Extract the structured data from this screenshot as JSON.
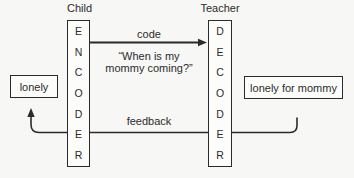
{
  "diagram": {
    "left_role": "Child",
    "right_role": "Teacher",
    "encoder_letters": [
      "E",
      "N",
      "C",
      "O",
      "D",
      "E",
      "R"
    ],
    "decoder_letters": [
      "D",
      "E",
      "C",
      "O",
      "D",
      "E",
      "R"
    ],
    "code_label": "code",
    "feedback_label": "feedback",
    "message_line1": "“When is my",
    "message_line2": "mommy coming?”",
    "left_feeling": "lonely",
    "right_feeling": "lonely for mommy",
    "colors": {
      "ink": "#2b2b2b",
      "background": "#f7f7f5",
      "box_fill": "#fcfcfb"
    }
  }
}
